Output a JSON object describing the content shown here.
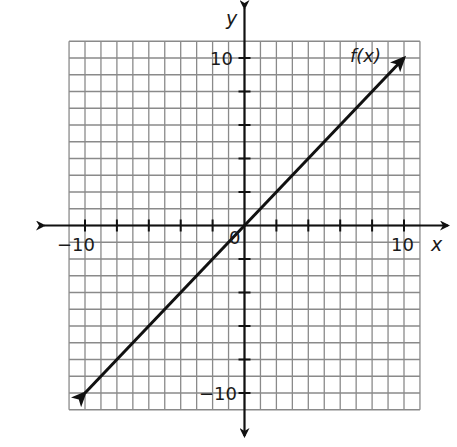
{
  "chart_data": {
    "type": "line",
    "title": "",
    "function_label": "f(x)",
    "xlabel": "x",
    "ylabel": "y",
    "xlim": [
      -11,
      11
    ],
    "ylim": [
      -11,
      11
    ],
    "grid": true,
    "grid_step": 1,
    "tick_step": 2,
    "tick_labels": {
      "x": [
        "-10",
        "10"
      ],
      "y": [
        "10",
        "-10"
      ],
      "origin": "0"
    },
    "series": [
      {
        "name": "f(x)",
        "x": [
          -10,
          10
        ],
        "y": [
          -10,
          10
        ],
        "arrows_both_ends": true
      }
    ],
    "legend": "none",
    "colors": {
      "line": "#111111",
      "grid": "#8a8a8a",
      "axis": "#111111"
    }
  },
  "labels": {
    "y_axis": "y",
    "x_axis": "x",
    "y_pos": "10",
    "y_neg": "−10",
    "x_pos": "10",
    "x_neg": "−10",
    "origin": "0",
    "func": "f(x)"
  }
}
